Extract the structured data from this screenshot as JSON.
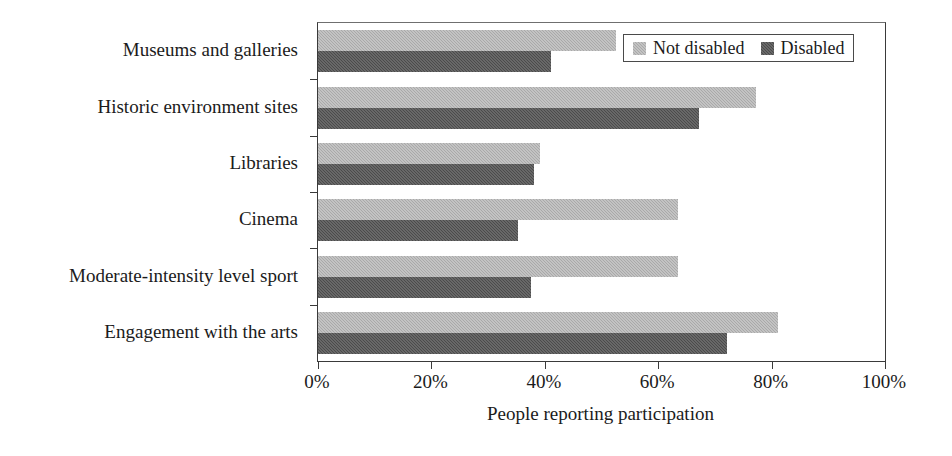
{
  "chart_data": {
    "type": "bar",
    "orientation": "horizontal",
    "title": "",
    "xlabel": "People reporting participation",
    "ylabel": "",
    "xlim": [
      0,
      100
    ],
    "xticks": [
      "0%",
      "20%",
      "40%",
      "60%",
      "80%",
      "100%"
    ],
    "xtick_values": [
      0,
      20,
      40,
      60,
      80,
      100
    ],
    "grid": false,
    "legend_position": "top-right",
    "categories": [
      "Museums and galleries",
      "Historic environment sites",
      "Libraries",
      "Cinema",
      "Moderate-intensity level sport",
      "Engagement with the arts"
    ],
    "series": [
      {
        "name": "Not disabled",
        "color": "#a9a9a9",
        "values": [
          52.6,
          77.2,
          39.2,
          63.5,
          63.5,
          81.1
        ]
      },
      {
        "name": "Disabled",
        "color": "#4b4b4b",
        "values": [
          41.1,
          67.2,
          38.1,
          35.3,
          37.6,
          72.1
        ]
      }
    ]
  },
  "legend": {
    "entries": [
      {
        "label": "Not disabled",
        "swatch": "light-gray-swatch"
      },
      {
        "label": "Disabled",
        "swatch": "dark-gray-swatch"
      }
    ]
  },
  "colors": {
    "not_disabled": "#a9a9a9",
    "disabled": "#4b4b4b",
    "axis": "#3a3a3a",
    "text": "#1b1b1b",
    "background": "#ffffff"
  }
}
